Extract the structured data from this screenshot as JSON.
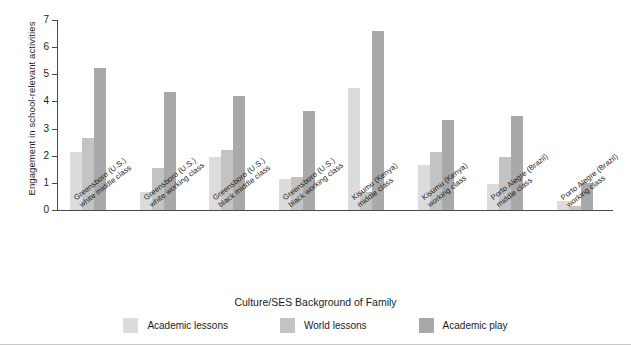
{
  "chart_data": {
    "type": "bar",
    "title": "",
    "xlabel": "Culture/SES Background of Family",
    "ylabel": "Engagement in school-relevant activities",
    "ylim": [
      0,
      7
    ],
    "yticks": [
      0,
      1,
      2,
      3,
      4,
      5,
      6,
      7
    ],
    "grid": false,
    "legend_position": "bottom",
    "categories": [
      "Greensboro (U.S.) white middle class",
      "Greensboro (U.S.) white working class",
      "Greensboro (U.S.) black middle class",
      "Greensboro (U.S.) black working class",
      "Kisumu (Kenya) middle class",
      "Kisumu (Kenya) working class",
      "Porto Alegre (Brazil) middle class",
      "Porto Alegre (Brazil) working class"
    ],
    "category_lines": [
      [
        "Greensboro (U.S.)",
        "white middle class"
      ],
      [
        "Greensboro (U.S.)",
        "white working class"
      ],
      [
        "Greensboro (U.S.)",
        "black middle class"
      ],
      [
        "Greensboro (U.S.)",
        "black working class"
      ],
      [
        "Kisumu (Kenya)",
        "middle class"
      ],
      [
        "Kisumu (Kenya)",
        "working class"
      ],
      [
        "Porto Alegre (Brazil)",
        "middle class"
      ],
      [
        "Porto Alegre (Brazil)",
        "working class"
      ]
    ],
    "series": [
      {
        "name": "Academic lessons",
        "color": "#dcdcdc",
        "values": [
          2.15,
          0.65,
          1.95,
          1.15,
          4.5,
          1.65,
          0.95,
          0.35
        ]
      },
      {
        "name": "World lessons",
        "color": "#c3c3c3",
        "values": [
          2.65,
          1.55,
          2.2,
          1.2,
          0.65,
          2.15,
          1.95,
          0.15
        ]
      },
      {
        "name": "Academic play",
        "color": "#a9a9a9",
        "values": [
          5.25,
          4.35,
          4.2,
          3.65,
          6.6,
          3.3,
          3.45,
          1.0
        ]
      }
    ]
  },
  "legend": {
    "items": [
      {
        "label": "Academic lessons",
        "color": "#dcdcdc"
      },
      {
        "label": "World lessons",
        "color": "#c3c3c3"
      },
      {
        "label": "Academic play",
        "color": "#a9a9a9"
      }
    ]
  },
  "axes": {
    "y_title": "Engagement in school-relevant activities",
    "x_title": "Culture/SES Background of Family",
    "y_ticks": [
      "0",
      "1",
      "2",
      "3",
      "4",
      "5",
      "6",
      "7"
    ]
  }
}
